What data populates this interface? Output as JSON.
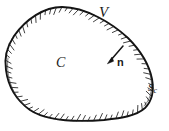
{
  "figure": {
    "kind": "line-drawing",
    "background_color": "#ffffff",
    "ink_color": "#1a1a1a",
    "width": 169,
    "height": 131,
    "labels": {
      "volume": "V",
      "interior": "C",
      "normal": "n",
      "surface": "S",
      "surface_subscript": "c"
    },
    "annotations": [
      {
        "name": "volume-label",
        "text": "V",
        "x": 99,
        "y": 5,
        "style": "italic",
        "placement": "outside-top-right"
      },
      {
        "name": "interior-label",
        "text": "C",
        "x": 56,
        "y": 56,
        "style": "italic",
        "placement": "inside-center-left"
      },
      {
        "name": "normal-label",
        "text": "n",
        "x": 117,
        "y": 57,
        "style": "bold",
        "placement": "inside-near-arrow"
      },
      {
        "name": "surface-label",
        "text": "Sc",
        "x": 148,
        "y": 82,
        "style": "italic-subscript",
        "placement": "on-boundary-right"
      }
    ],
    "normal_arrow": {
      "name": "inward-normal-arrow",
      "start_x": 123,
      "start_y": 46,
      "end_x": 108,
      "end_y": 63,
      "direction": "inward (down-left)"
    },
    "boundary": {
      "name": "closed-curve",
      "hatching_side": "interior",
      "hatch_count": 74,
      "path": "M 62 7 C 44 7 26 19 14 36 C 6 48 4 58 6 70 C 8 86 16 100 30 110 C 48 122 78 122 104 120 C 122 118 136 116 145 108 C 153 100 154 90 152 79 C 149 64 140 50 128 38 C 113 24 86 7 62 7 Z"
    }
  }
}
